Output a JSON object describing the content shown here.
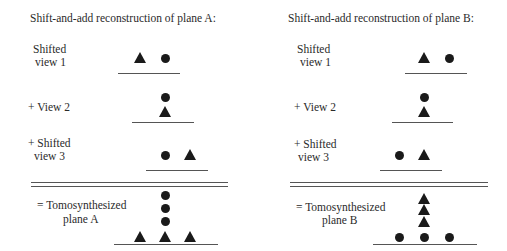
{
  "panels": [
    {
      "id": "A",
      "title": "Shift-and-add reconstruction of plane A:",
      "rows": [
        {
          "label_line1": "Shifted",
          "label_line2": "view 1",
          "symbols": [
            "triangle",
            "circle"
          ]
        },
        {
          "label_line1": "+ View 2",
          "label_line2": "",
          "symbols": [
            "circle-above",
            "triangle-below"
          ]
        },
        {
          "label_line1": "+ Shifted",
          "label_line2": "view 3",
          "symbols": [
            "circle",
            "triangle"
          ]
        },
        {
          "label_line1": "= Tomosynthesized",
          "label_line2": "plane A",
          "symbols": [
            "3 circles stacked",
            "3 triangles in row"
          ]
        }
      ]
    },
    {
      "id": "B",
      "title": "Shift-and-add reconstruction of plane B:",
      "rows": [
        {
          "label_line1": "Shifted",
          "label_line2": "view 1",
          "symbols": [
            "triangle",
            "circle"
          ]
        },
        {
          "label_line1": "+ View 2",
          "label_line2": "",
          "symbols": [
            "circle-above",
            "triangle-below"
          ]
        },
        {
          "label_line1": "+ Shifted",
          "label_line2": "view 3",
          "symbols": [
            "circle",
            "triangle"
          ]
        },
        {
          "label_line1": "= Tomosynthesized",
          "label_line2": "plane B",
          "symbols": [
            "3 triangles stacked",
            "3 circles in row"
          ]
        }
      ]
    }
  ],
  "colors": {
    "symbol": "#1a1a1a",
    "text": "#2a2a2a",
    "line": "#555555"
  }
}
